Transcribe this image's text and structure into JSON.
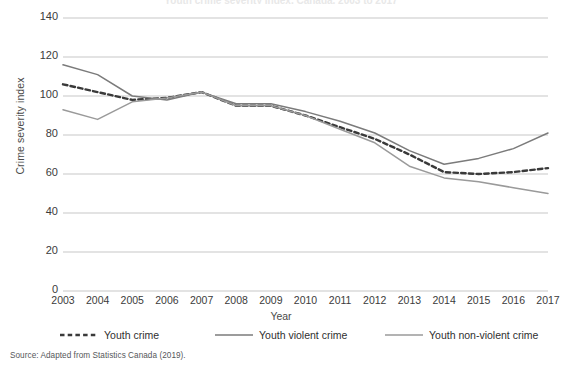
{
  "figure": {
    "title": "Youth crime severity index, Canada, 2003 to 2017",
    "source_note": "Source: Adapted from Statistics Canada (2019)."
  },
  "chart_data": {
    "type": "line",
    "title": "Youth crime severity index, Canada, 2003 to 2017",
    "xlabel": "Year",
    "ylabel": "Crime severity index",
    "xlim": [
      2003,
      2017
    ],
    "ylim": [
      0,
      140
    ],
    "ytick_labels": [
      "0",
      "20",
      "40",
      "60",
      "80",
      "100",
      "120",
      "140"
    ],
    "yticks": [
      0,
      20,
      40,
      60,
      80,
      100,
      120,
      140
    ],
    "grid": "horizontal",
    "legend_position": "bottom",
    "categories": [
      "2003",
      "2004",
      "2005",
      "2006",
      "2007",
      "2008",
      "2009",
      "2010",
      "2011",
      "2012",
      "2013",
      "2014",
      "2015",
      "2016",
      "2017"
    ],
    "x": [
      2003,
      2004,
      2005,
      2006,
      2007,
      2008,
      2009,
      2010,
      2011,
      2012,
      2013,
      2014,
      2015,
      2016,
      2017
    ],
    "series": [
      {
        "name": "Youth crime",
        "style": "dashed",
        "color": "#3a3a3a",
        "values": [
          106,
          102,
          98,
          99,
          102,
          95,
          95,
          90,
          84,
          78,
          70,
          61,
          60,
          61,
          63
        ]
      },
      {
        "name": "Youth violent crime",
        "style": "solid",
        "color": "#7b7b7b",
        "values": [
          116,
          111,
          100,
          98,
          102,
          96,
          96,
          92,
          87,
          81,
          72,
          65,
          68,
          73,
          81
        ]
      },
      {
        "name": "Youth non-violent crime",
        "style": "solid",
        "color": "#9a9a9a",
        "values": [
          93,
          88,
          97,
          99,
          102,
          95,
          95,
          90,
          83,
          76,
          64,
          58,
          56,
          53,
          50
        ]
      }
    ]
  }
}
